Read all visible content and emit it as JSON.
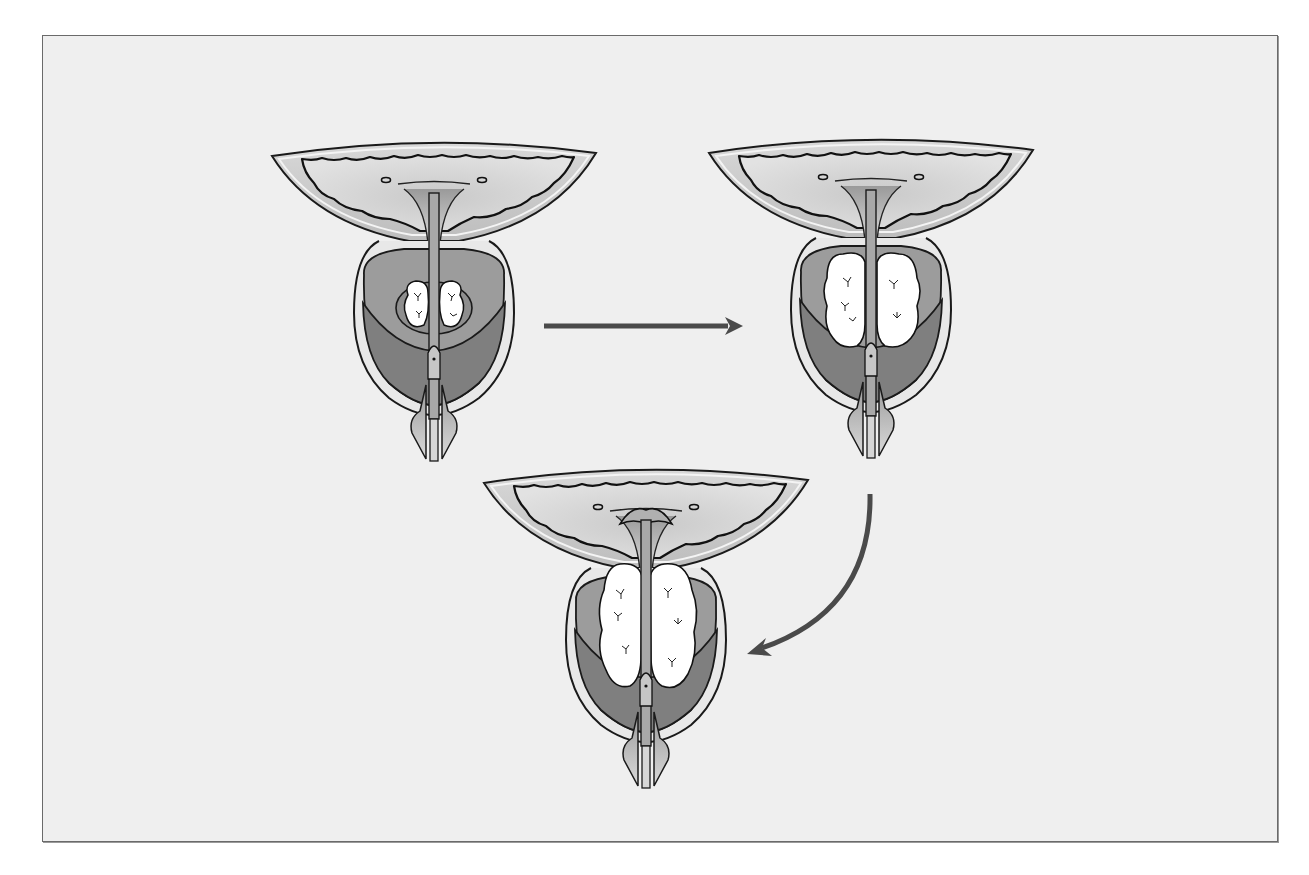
{
  "figure": {
    "title": "Progressive enlargement of the prostate (benign prostatic hyperplasia)",
    "background_color": "#efefef",
    "border_color": "#6a6a6a",
    "colors": {
      "bladder_wall": "#c4c4c4",
      "bladder_lumen": "#dedede",
      "capsule": "#e6e6e6",
      "central_zone": "#9c9c9c",
      "peripheral_zone": "#7f7f7f",
      "adenoma": "#ffffff",
      "outline": "#1a1a1a",
      "arrow": "#4a4a4a"
    },
    "stages": [
      {
        "id": "stage-1",
        "label": "Normal / early hyperplasia",
        "cx": 434,
        "top": 153,
        "nodule_size": "small"
      },
      {
        "id": "stage-2",
        "label": "Moderate hyperplasia",
        "cx": 871,
        "top": 150,
        "nodule_size": "medium"
      },
      {
        "id": "stage-3",
        "label": "Advanced hyperplasia",
        "cx": 646,
        "top": 480,
        "nodule_size": "large"
      }
    ],
    "arrows": [
      {
        "id": "arrow-1-to-2",
        "type": "straight",
        "from": [
          544,
          326
        ],
        "to": [
          743,
          326
        ]
      },
      {
        "id": "arrow-2-to-3",
        "type": "curved",
        "from": [
          870,
          494
        ],
        "to": [
          747,
          654
        ]
      }
    ]
  }
}
